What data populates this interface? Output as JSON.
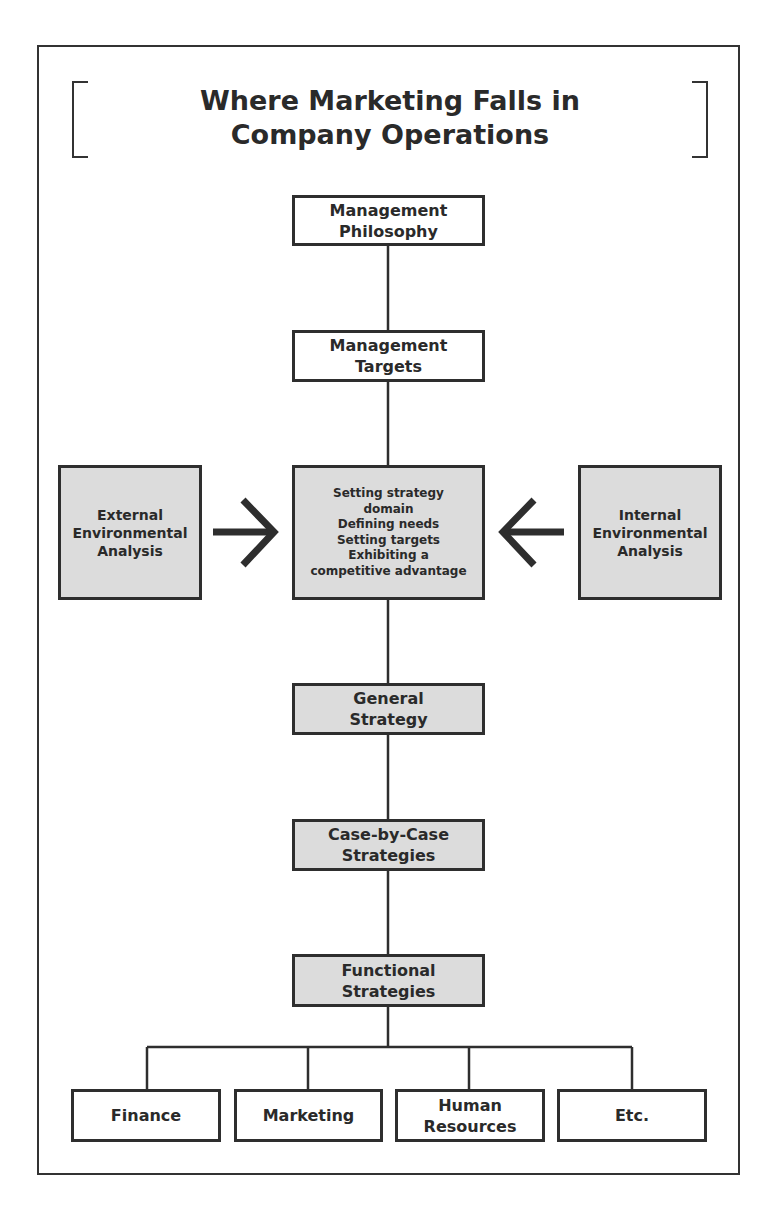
{
  "title": "Where Marketing Falls in\nCompany Operations",
  "nodes": {
    "management_philosophy": "Management\nPhilosophy",
    "management_targets": "Management\nTargets",
    "external_analysis": "External\nEnvironmental\nAnalysis",
    "core": "Setting strategy\ndomain\nDefining needs\nSetting targets\nExhibiting a\ncompetitive advantage",
    "internal_analysis": "Internal\nEnvironmental\nAnalysis",
    "general_strategy": "General\nStrategy",
    "case_strategies": "Case-by-Case\nStrategies",
    "functional_strategies": "Functional\nStrategies"
  },
  "functions": [
    {
      "label": "Finance"
    },
    {
      "label": "Marketing"
    },
    {
      "label": "Human\nResources"
    },
    {
      "label": "Etc."
    }
  ],
  "colors": {
    "box_fill_gray": "#dcdcdc",
    "line": "#2e2e2e"
  }
}
